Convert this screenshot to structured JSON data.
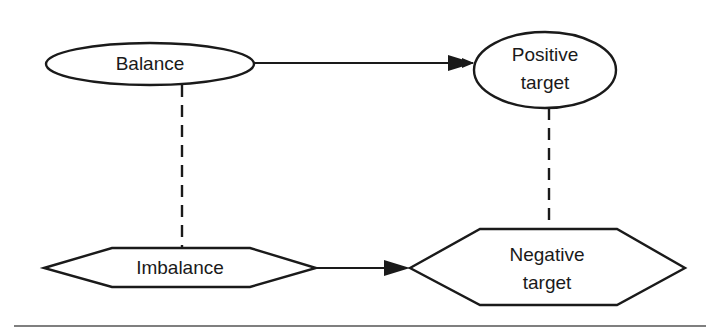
{
  "diagram": {
    "nodes": [
      {
        "id": "balance",
        "label": "Balance",
        "shape": "ellipse"
      },
      {
        "id": "positive_target",
        "label_line1": "Positive",
        "label_line2": "target",
        "shape": "ellipse"
      },
      {
        "id": "imbalance",
        "label": "Imbalance",
        "shape": "hexagon"
      },
      {
        "id": "negative_target",
        "label_line1": "Negative",
        "label_line2": "target",
        "shape": "hexagon"
      }
    ],
    "edges": [
      {
        "from": "balance",
        "to": "positive_target",
        "style": "solid-arrow"
      },
      {
        "from": "imbalance",
        "to": "negative_target",
        "style": "solid-arrow"
      },
      {
        "from": "balance",
        "to": "imbalance",
        "style": "dashed"
      },
      {
        "from": "positive_target",
        "to": "negative_target",
        "style": "dashed"
      }
    ],
    "colors": {
      "stroke": "#1a1a1a",
      "background": "#ffffff"
    }
  }
}
